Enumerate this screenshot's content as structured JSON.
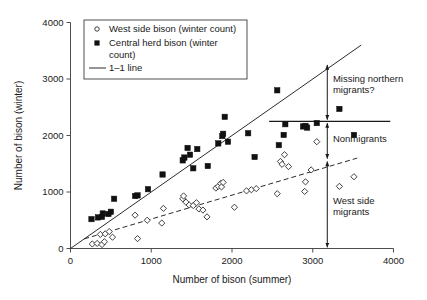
{
  "chart_data": {
    "type": "scatter",
    "title": "",
    "xlabel": "Number of bison (summer)",
    "ylabel": "Number of bison (winter)",
    "xlim": [
      0,
      4000
    ],
    "ylim": [
      0,
      4000
    ],
    "xticks": [
      0,
      1000,
      2000,
      3000,
      4000
    ],
    "yticks": [
      0,
      1000,
      2000,
      3000,
      4000
    ],
    "xtick_labels": [
      "0",
      "1000",
      "2000",
      "3000",
      "4000"
    ],
    "ytick_labels": [
      "0",
      "1000",
      "2000",
      "3000",
      "4000"
    ],
    "grid": false,
    "legend_position": "top-left",
    "series": [
      {
        "name": "West side bison (winter count)",
        "marker": "open-diamond",
        "points": [
          [
            270,
            80
          ],
          [
            330,
            90
          ],
          [
            370,
            250
          ],
          [
            390,
            70
          ],
          [
            420,
            120
          ],
          [
            430,
            260
          ],
          [
            480,
            300
          ],
          [
            520,
            200
          ],
          [
            800,
            590
          ],
          [
            830,
            175
          ],
          [
            950,
            500
          ],
          [
            1130,
            450
          ],
          [
            1150,
            710
          ],
          [
            1390,
            880
          ],
          [
            1400,
            930
          ],
          [
            1430,
            820
          ],
          [
            1470,
            770
          ],
          [
            1520,
            760
          ],
          [
            1560,
            810
          ],
          [
            1590,
            700
          ],
          [
            1640,
            680
          ],
          [
            1690,
            560
          ],
          [
            1800,
            1070
          ],
          [
            1830,
            1100
          ],
          [
            1860,
            1150
          ],
          [
            1870,
            1090
          ],
          [
            1890,
            1170
          ],
          [
            2030,
            730
          ],
          [
            2180,
            1020
          ],
          [
            2240,
            1040
          ],
          [
            2300,
            1060
          ],
          [
            2560,
            970
          ],
          [
            2600,
            1540
          ],
          [
            2620,
            1490
          ],
          [
            2650,
            1660
          ],
          [
            2700,
            1450
          ],
          [
            2900,
            1010
          ],
          [
            2910,
            1180
          ],
          [
            2980,
            1390
          ],
          [
            3050,
            1890
          ],
          [
            3330,
            1100
          ],
          [
            3510,
            1270
          ]
        ]
      },
      {
        "name": "Central herd bison (winter count)",
        "marker": "filled-square",
        "points": [
          [
            260,
            520
          ],
          [
            340,
            550
          ],
          [
            390,
            560
          ],
          [
            400,
            620
          ],
          [
            470,
            610
          ],
          [
            500,
            650
          ],
          [
            540,
            880
          ],
          [
            800,
            930
          ],
          [
            830,
            940
          ],
          [
            960,
            1050
          ],
          [
            1140,
            1310
          ],
          [
            1390,
            1560
          ],
          [
            1410,
            1610
          ],
          [
            1450,
            1780
          ],
          [
            1480,
            1660
          ],
          [
            1520,
            1420
          ],
          [
            1570,
            1760
          ],
          [
            1700,
            1460
          ],
          [
            1830,
            1860
          ],
          [
            1880,
            1990
          ],
          [
            1890,
            2030
          ],
          [
            1910,
            2330
          ],
          [
            1950,
            1890
          ],
          [
            2200,
            2040
          ],
          [
            2280,
            1620
          ],
          [
            2560,
            2800
          ],
          [
            2580,
            1830
          ],
          [
            2640,
            2010
          ],
          [
            2660,
            2200
          ],
          [
            2880,
            2160
          ],
          [
            2910,
            2170
          ],
          [
            2930,
            2140
          ],
          [
            3050,
            2220
          ],
          [
            3330,
            2470
          ],
          [
            3510,
            2010
          ]
        ]
      }
    ],
    "reference_lines": [
      {
        "name": "1-1 line",
        "style": "solid",
        "from": [
          0,
          0
        ],
        "to": [
          3600,
          3600
        ]
      },
      {
        "name": "west-side-trend",
        "style": "dashed",
        "from": [
          170,
          170
        ],
        "to": [
          3550,
          1600
        ]
      },
      {
        "name": "nonmigrant-threshold",
        "style": "solid-horizontal",
        "y": 2250,
        "from_x": 2460,
        "to_x": 3960
      }
    ],
    "annotations": [
      {
        "label": "Missing northern\nmigrants?",
        "line1": "Missing northern",
        "line2": "migrants?",
        "arrow_x": 3180,
        "arrow_from_y": 3250,
        "arrow_to_y": 2280,
        "text_x": 3250,
        "text_y": 2950
      },
      {
        "label": "Nonmigrants",
        "line1": "Nonmigrants",
        "line2": "",
        "arrow_x": 3180,
        "arrow_from_y": 2220,
        "arrow_to_y": 1590,
        "text_x": 3250,
        "text_y": 1890
      },
      {
        "label": "West side\nmigrants",
        "line1": "West side",
        "line2": "migrants",
        "arrow_x": 3180,
        "arrow_from_y": 1540,
        "arrow_to_y": 20,
        "text_x": 3250,
        "text_y": 790
      }
    ],
    "legend_entries": [
      {
        "marker": "open-circle",
        "line1": "West side bison (winter count)",
        "line2": ""
      },
      {
        "marker": "filled-square",
        "line1": "Central herd bison (winter",
        "line2": "count)"
      },
      {
        "marker": "line",
        "line1": "1–1 line",
        "line2": ""
      }
    ],
    "colors": {
      "marker_fill_dark": "#111111",
      "marker_stroke": "#2b2b2b",
      "axis": "#4d4d4d",
      "text": "#1a1a1a",
      "background": "#ffffff"
    }
  }
}
